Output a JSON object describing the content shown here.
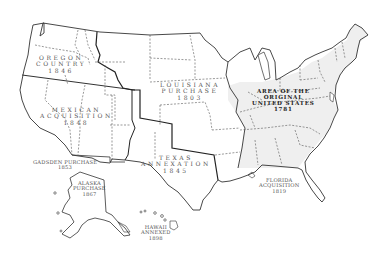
{
  "map": {
    "title": "Territorial Acquisitions of the United States",
    "colors": {
      "background": "#ffffff",
      "original_states_fill": "#efefef",
      "outline": "#333333",
      "state_border_dashed": "#555555",
      "label_text": "#555555",
      "original_label_text": "#222222"
    },
    "regions": [
      {
        "id": "oregon",
        "lines": [
          "OREGON",
          "COUNTRY",
          "1846"
        ]
      },
      {
        "id": "mexican",
        "lines": [
          "MEXICAN",
          "ACQUISITION",
          "1848"
        ]
      },
      {
        "id": "louisiana",
        "lines": [
          "LOUISIANA",
          "PURCHASE",
          "1803"
        ]
      },
      {
        "id": "original",
        "lines": [
          "AREA OF THE",
          "ORIGINAL",
          "UNITED STATES",
          "1781"
        ]
      },
      {
        "id": "texas",
        "lines": [
          "TEXAS",
          "ANNEXATION",
          "1845"
        ]
      },
      {
        "id": "gadsden",
        "lines": [
          "GADSDEN PURCHASE",
          "1853"
        ]
      },
      {
        "id": "alaska",
        "lines": [
          "ALASKA",
          "PURCHASE",
          "1867"
        ]
      },
      {
        "id": "hawaii",
        "lines": [
          "HAWAII",
          "ANNEXED",
          "1898"
        ]
      },
      {
        "id": "florida",
        "lines": [
          "FLORIDA",
          "ACQUISITION",
          "1819"
        ]
      }
    ]
  }
}
